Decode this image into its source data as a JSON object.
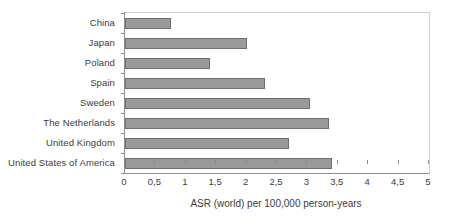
{
  "chart_data": {
    "type": "bar",
    "orientation": "horizontal",
    "title": "",
    "xlabel": "ASR (world) per 100,000 person-years",
    "ylabel": "",
    "xlim": [
      0,
      5
    ],
    "grid": false,
    "legend": false,
    "decimal_separator": ",",
    "categories": [
      "China",
      "Japan",
      "Poland",
      "Spain",
      "Sweden",
      "The Netherlands",
      "United Kingdom",
      "United States of America"
    ],
    "values": [
      0.75,
      2.0,
      1.4,
      2.3,
      3.05,
      3.35,
      2.7,
      3.4
    ],
    "xticks": [
      0,
      0.5,
      1,
      1.5,
      2,
      2.5,
      3,
      3.5,
      4,
      4.5,
      5
    ],
    "xtick_labels": [
      "0",
      "0,5",
      "1",
      "1,5",
      "2",
      "2,5",
      "3",
      "3,5",
      "4",
      "4,5",
      "5"
    ],
    "colors": {
      "bar_fill": "#9a9a9a",
      "bar_stroke": "#6f6f6f",
      "axis": "#8d8d8d",
      "plot_border_light": "#cfcfcf",
      "text": "#3c3c3c",
      "background": "#ffffff"
    }
  }
}
